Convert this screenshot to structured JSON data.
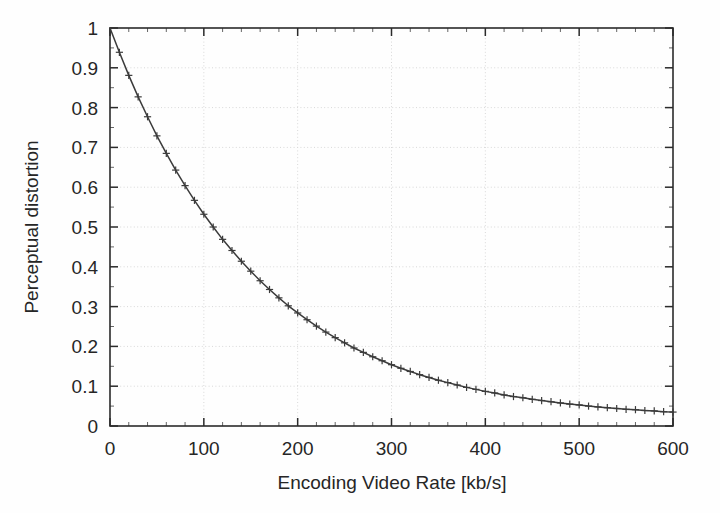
{
  "chart_data": {
    "type": "line",
    "title": "",
    "subtitle": "",
    "xlabel": "Encoding Video  Rate [kb/s]",
    "ylabel": "Perceptual distortion",
    "xlim": [
      0,
      600
    ],
    "ylim": [
      0,
      1
    ],
    "grid": true,
    "legend": null,
    "marker": "plus",
    "line_color": "#3b3b3b",
    "xticks": [
      0,
      100,
      200,
      300,
      400,
      500,
      600
    ],
    "xtick_labels": [
      "0",
      "100",
      "200",
      "300",
      "400",
      "500",
      "600"
    ],
    "yticks": [
      0,
      0.1,
      0.2,
      0.3,
      0.4,
      0.5,
      0.6,
      0.7,
      0.8,
      0.9,
      1
    ],
    "ytick_labels": [
      "0",
      "0.1",
      "0.2",
      "0.3",
      "0.4",
      "0.5",
      "0.6",
      "0.7",
      "0.8",
      "0.9",
      "1"
    ],
    "x": [
      0,
      10,
      20,
      30,
      40,
      50,
      60,
      70,
      80,
      90,
      100,
      110,
      120,
      130,
      140,
      150,
      160,
      170,
      180,
      190,
      200,
      210,
      220,
      230,
      240,
      250,
      260,
      270,
      280,
      290,
      300,
      310,
      320,
      330,
      340,
      350,
      360,
      370,
      380,
      390,
      400,
      410,
      420,
      430,
      440,
      450,
      460,
      470,
      480,
      490,
      500,
      510,
      520,
      530,
      540,
      550,
      560,
      570,
      580,
      590,
      600
    ],
    "values": [
      1.0,
      0.939,
      0.881,
      0.827,
      0.777,
      0.729,
      0.685,
      0.643,
      0.604,
      0.567,
      0.532,
      0.5,
      0.469,
      0.441,
      0.414,
      0.389,
      0.365,
      0.343,
      0.322,
      0.302,
      0.284,
      0.267,
      0.251,
      0.236,
      0.222,
      0.209,
      0.196,
      0.185,
      0.174,
      0.164,
      0.154,
      0.145,
      0.137,
      0.129,
      0.122,
      0.115,
      0.109,
      0.103,
      0.097,
      0.092,
      0.087,
      0.083,
      0.078,
      0.074,
      0.071,
      0.067,
      0.064,
      0.061,
      0.058,
      0.055,
      0.053,
      0.05,
      0.048,
      0.046,
      0.044,
      0.042,
      0.041,
      0.039,
      0.038,
      0.036,
      0.035
    ],
    "series": [
      {
        "name": "rate-distortion",
        "values": [
          1.0,
          0.939,
          0.881,
          0.827,
          0.777,
          0.729,
          0.685,
          0.643,
          0.604,
          0.567,
          0.532,
          0.5,
          0.469,
          0.441,
          0.414,
          0.389,
          0.365,
          0.343,
          0.322,
          0.302,
          0.284,
          0.267,
          0.251,
          0.236,
          0.222,
          0.209,
          0.196,
          0.185,
          0.174,
          0.164,
          0.154,
          0.145,
          0.137,
          0.129,
          0.122,
          0.115,
          0.109,
          0.103,
          0.097,
          0.092,
          0.087,
          0.083,
          0.078,
          0.074,
          0.071,
          0.067,
          0.064,
          0.061,
          0.058,
          0.055,
          0.053,
          0.05,
          0.048,
          0.046,
          0.044,
          0.042,
          0.041,
          0.039,
          0.038,
          0.036,
          0.035
        ]
      }
    ]
  }
}
